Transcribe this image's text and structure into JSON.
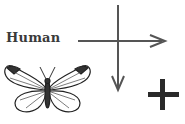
{
  "diagram": {
    "label": "Human",
    "icons": {
      "butterfly": "butterfly-icon",
      "plus": "plus-icon",
      "arrow_right": "arrow-right-icon",
      "arrow_down": "arrow-down-icon"
    },
    "colors": {
      "arrow": "#555555",
      "plus": "#2a2a2a",
      "text": "#3a3a3a"
    }
  }
}
